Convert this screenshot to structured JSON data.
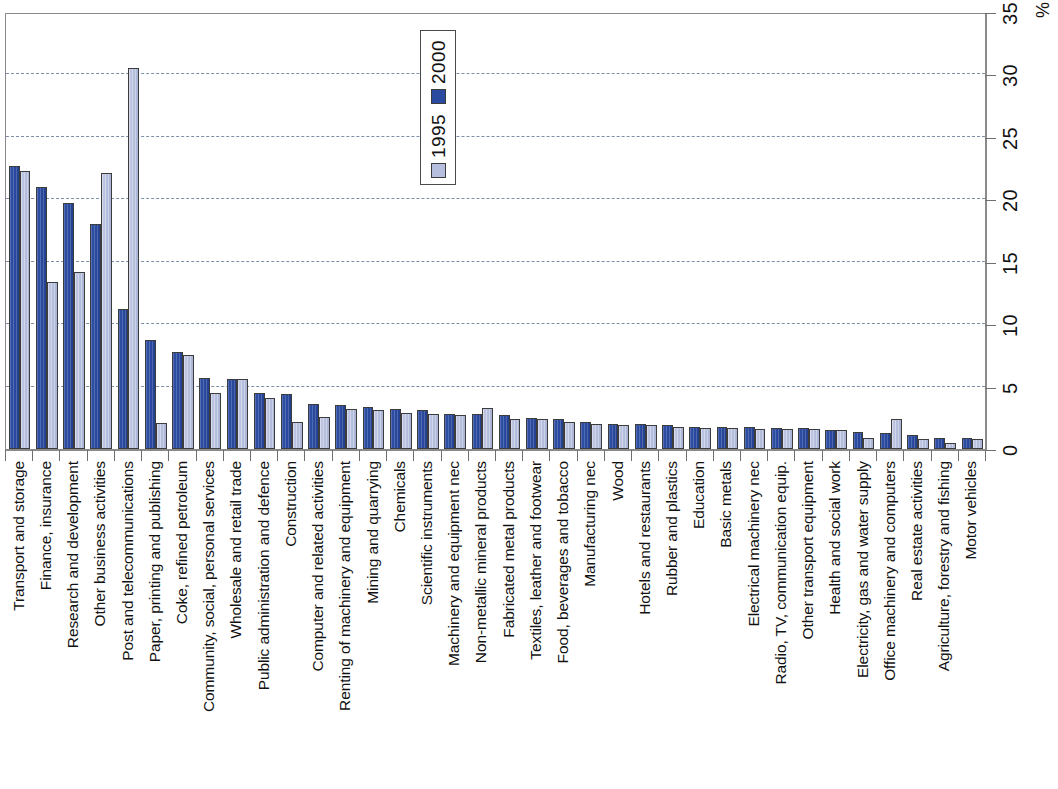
{
  "chart_data": {
    "type": "bar",
    "title": "",
    "subtitle": "",
    "xlabel": "",
    "ylabel": "%",
    "ylim": [
      0,
      35
    ],
    "yticks": [
      0,
      5,
      10,
      15,
      20,
      25,
      30,
      35
    ],
    "ytick_labels": [
      "0",
      "5",
      "10",
      "15",
      "20",
      "25",
      "30",
      "35"
    ],
    "grid": "horizontal-dashed",
    "legend_position": "top-center-inside",
    "orientation": "vertical-bars-rotated-labels",
    "categories": [
      "Transport and storage",
      "Finance, insurance",
      "Research and development",
      "Other business activities",
      "Post and telecommunications",
      "Paper, printing and publishing",
      "Coke, refined petroleum",
      "Community, social, personal services",
      "Wholesale and retail trade",
      "Public administration and defence",
      "Construction",
      "Computer and related activities",
      "Renting of machinery and equipment",
      "Mining and quarrying",
      "Chemicals",
      "Scientific instruments",
      "Machinery and equipment nec",
      "Non-metallic mineral products",
      "Fabricated metal products",
      "Textiles, leather and footwear",
      "Food, beverages and tobacco",
      "Manufacturing nec",
      "Wood",
      "Hotels and restaurants",
      "Rubber and plastics",
      "Education",
      "Basic metals",
      "Electrical machinery nec",
      "Radio, TV, communication equip.",
      "Other transport equipment",
      "Health and social work",
      "Electricity, gas and water supply",
      "Office machinery and computers",
      "Real estate activities",
      "Agriculture, forestry and fishing",
      "Motor vehicles"
    ],
    "series": [
      {
        "name": "2000",
        "color": "#2b4ba0",
        "values": [
          22.7,
          21.0,
          19.7,
          18.0,
          11.2,
          8.7,
          7.8,
          5.7,
          5.6,
          4.5,
          4.4,
          3.6,
          3.5,
          3.4,
          3.2,
          3.1,
          2.8,
          2.8,
          2.7,
          2.5,
          2.4,
          2.2,
          2.0,
          2.0,
          1.9,
          1.8,
          1.8,
          1.8,
          1.7,
          1.7,
          1.5,
          1.4,
          1.3,
          1.1,
          0.9,
          0.9
        ]
      },
      {
        "name": "1995",
        "color": "#b6bfdd",
        "values": [
          22.3,
          13.4,
          14.2,
          22.1,
          30.5,
          2.1,
          7.5,
          4.5,
          5.6,
          4.1,
          2.2,
          2.6,
          3.2,
          3.1,
          2.9,
          2.8,
          2.7,
          3.3,
          2.4,
          2.4,
          2.2,
          2.0,
          1.9,
          1.9,
          1.8,
          1.7,
          1.7,
          1.6,
          1.6,
          1.6,
          1.5,
          0.9,
          2.4,
          0.8,
          0.5,
          0.8
        ]
      }
    ],
    "legend": [
      {
        "label": "1995",
        "color": "#b6bfdd"
      },
      {
        "label": "2000",
        "color": "#2b4ba0"
      }
    ]
  }
}
